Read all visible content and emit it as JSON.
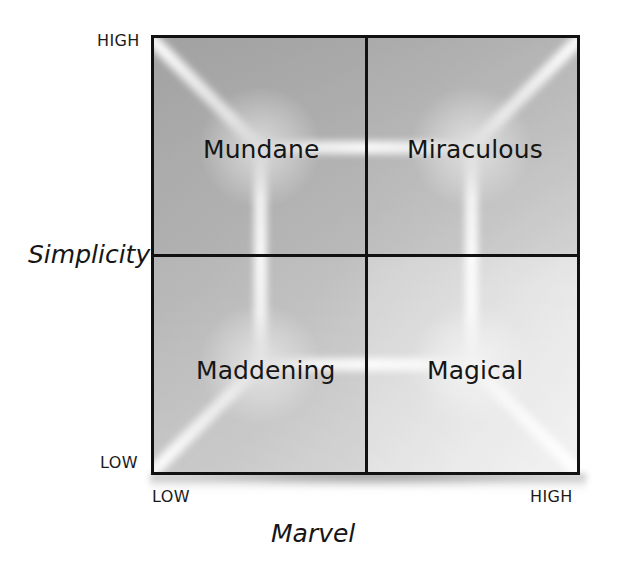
{
  "chart_data": {
    "type": "matrix",
    "title": "",
    "xlabel": "Marvel",
    "ylabel": "Simplicity",
    "x_ticks": [
      "LOW",
      "HIGH"
    ],
    "y_ticks": [
      "LOW",
      "HIGH"
    ],
    "grid": true,
    "legend": "none",
    "quadrants": [
      {
        "id": "top-left",
        "label": "Mundane",
        "x": "LOW",
        "y": "HIGH"
      },
      {
        "id": "top-right",
        "label": "Miraculous",
        "x": "HIGH",
        "y": "HIGH"
      },
      {
        "id": "bottom-left",
        "label": "Maddening",
        "x": "LOW",
        "y": "LOW"
      },
      {
        "id": "bottom-right",
        "label": "Magical",
        "x": "HIGH",
        "y": "LOW"
      }
    ]
  },
  "axes": {
    "y": {
      "title": "Simplicity",
      "high_label": "HIGH",
      "low_label": "LOW"
    },
    "x": {
      "title": "Marvel",
      "low_label": "LOW",
      "high_label": "HIGH"
    }
  },
  "quadrant_labels": {
    "top_left": "Mundane",
    "top_right": "Miraculous",
    "bottom_left": "Maddening",
    "bottom_right": "Magical"
  },
  "colors": {
    "frame": "#111111",
    "text": "#161616",
    "background": "#ffffff",
    "plot_fill_dark": "#b4b4b4",
    "plot_fill_light": "#ececec"
  }
}
